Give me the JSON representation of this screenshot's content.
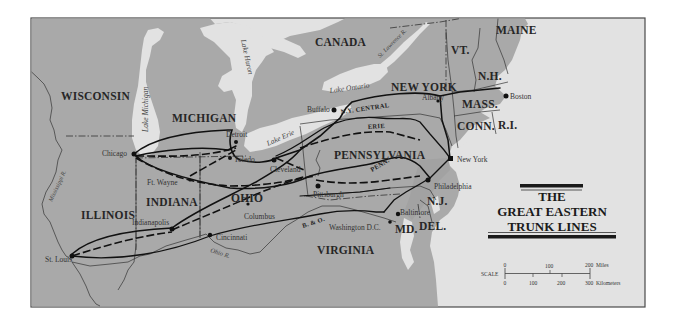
{
  "title": {
    "line1": "THE",
    "line2": "GREAT EASTERN",
    "line3": "TRUNK LINES"
  },
  "colors": {
    "land": "#a9a9a9",
    "land_dark": "#a2a2a2",
    "water": "#e2e2e2",
    "frame": "#4a4a4a",
    "rail": "#111111",
    "border": "#333333",
    "background": "#ffffff"
  },
  "regions": {
    "canada": "CANADA",
    "wisconsin": "WISCONSIN",
    "michigan": "MICHIGAN",
    "illinois": "ILLINOIS",
    "indiana": "INDIANA",
    "ohio": "OHIO",
    "pennsylvania": "PENNSYLVANIA",
    "new_york": "NEW YORK",
    "virginia": "VIRGINIA",
    "maine": "MAINE",
    "vermont": "VT.",
    "new_hampshire": "N.H.",
    "massachusetts": "MASS.",
    "connecticut": "CONN.",
    "rhode_island": "R.I.",
    "new_jersey": "N.J.",
    "maryland": "MD.",
    "delaware": "DEL."
  },
  "water_bodies": {
    "lake_michigan": "Lake Michigan",
    "lake_huron": "Lake Huron",
    "lake_erie": "Lake Erie",
    "lake_ontario": "Lake Ontario",
    "st_lawrence": "St. Lawrence R.",
    "mississippi": "Mississippi R.",
    "ohio_river": "Ohio R."
  },
  "cities": {
    "chicago": "Chicago",
    "detroit": "Detroit",
    "toledo": "Toledo",
    "cleveland": "Cleveland",
    "buffalo": "Buffalo",
    "albany": "Albany",
    "boston": "Boston",
    "new_york": "New York",
    "philadelphia": "Philadelphia",
    "pittsburgh": "Pittsburgh",
    "baltimore": "Baltimore",
    "washington": "Washington D.C.",
    "ft_wayne": "Ft. Wayne",
    "indianapolis": "Indianapolis",
    "columbus": "Columbus",
    "cincinnati": "Cincinnati",
    "st_louis": "St. Louis"
  },
  "rail_lines": {
    "ny_central": "N.Y. CENTRAL",
    "erie": "ERIE",
    "penn": "PENN.",
    "b_and_o": "B. & O."
  },
  "scale": {
    "label": "SCALE",
    "miles_ticks": [
      "0",
      "100",
      "200"
    ],
    "miles_unit": "Miles",
    "km_ticks": [
      "0",
      "100",
      "200",
      "300"
    ],
    "km_unit": "Kilometers"
  }
}
